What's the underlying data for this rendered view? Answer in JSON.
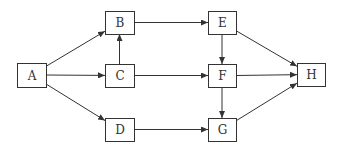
{
  "diagram": {
    "type": "directed-graph",
    "colors": {
      "stroke": "#333333",
      "background": "#ffffff",
      "text": "#333333"
    },
    "nodes": [
      {
        "id": "A",
        "label": "A",
        "x": 17,
        "y": 63,
        "w": 29,
        "h": 24
      },
      {
        "id": "B",
        "label": "B",
        "x": 105,
        "y": 11,
        "w": 29,
        "h": 23
      },
      {
        "id": "C",
        "label": "C",
        "x": 105,
        "y": 64,
        "w": 29,
        "h": 23
      },
      {
        "id": "D",
        "label": "D",
        "x": 105,
        "y": 118,
        "w": 29,
        "h": 23
      },
      {
        "id": "E",
        "label": "E",
        "x": 208,
        "y": 11,
        "w": 28,
        "h": 23
      },
      {
        "id": "F",
        "label": "F",
        "x": 208,
        "y": 64,
        "w": 28,
        "h": 23
      },
      {
        "id": "G",
        "label": "G",
        "x": 208,
        "y": 118,
        "w": 28,
        "h": 23
      },
      {
        "id": "H",
        "label": "H",
        "x": 297,
        "y": 63,
        "w": 28,
        "h": 23
      }
    ],
    "edges": [
      {
        "from": "A",
        "to": "B"
      },
      {
        "from": "A",
        "to": "C"
      },
      {
        "from": "A",
        "to": "D"
      },
      {
        "from": "C",
        "to": "B"
      },
      {
        "from": "B",
        "to": "E"
      },
      {
        "from": "C",
        "to": "F"
      },
      {
        "from": "D",
        "to": "G"
      },
      {
        "from": "E",
        "to": "F"
      },
      {
        "from": "F",
        "to": "G"
      },
      {
        "from": "E",
        "to": "H"
      },
      {
        "from": "F",
        "to": "H"
      },
      {
        "from": "G",
        "to": "H"
      }
    ]
  }
}
